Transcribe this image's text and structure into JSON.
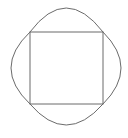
{
  "diagram": {
    "stroke_color": "#6b6b6b",
    "background": "#ffffff",
    "square": {
      "x1": 30,
      "y1": 32,
      "x2": 103,
      "y2": 104
    },
    "outline_extents": {
      "left": 11,
      "right": 121,
      "top": 8,
      "bottom": 125
    }
  }
}
